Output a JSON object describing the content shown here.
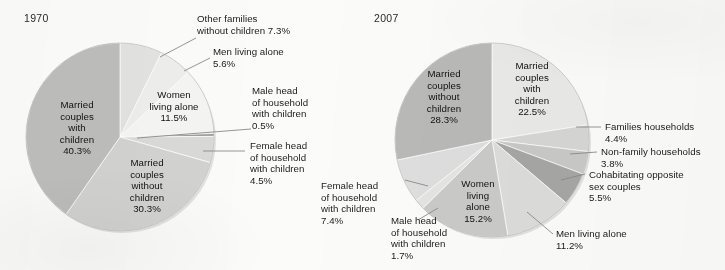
{
  "figure": {
    "background_color": "#fbfbf9",
    "text_color": "#1a1a1a"
  },
  "charts": [
    {
      "year_label": "1970",
      "center": [
        120,
        137
      ],
      "radius": 94
    },
    {
      "year_label": "2007",
      "center": [
        492,
        140
      ],
      "radius": 97
    }
  ],
  "chart_data": [
    {
      "type": "pie",
      "title": "1970",
      "legend": "none",
      "start_angle_deg": 0,
      "direction": "clockwise",
      "categories": [
        "Other families without children",
        "Men living alone",
        "Women living alone",
        "Male head of household with children",
        "Female head of household with children",
        "Married couples without children",
        "Married couples with children"
      ],
      "values": [
        7.3,
        5.6,
        11.5,
        0.5,
        4.5,
        30.3,
        40.3
      ],
      "value_suffix": "%",
      "colors": [
        "#e2e2e0",
        "#ededeb",
        "#f4f4f2",
        "#9e9e9c",
        "#d9d9d7",
        "#d2d2d0",
        "#bdbdbb"
      ]
    },
    {
      "type": "pie",
      "title": "2007",
      "legend": "none",
      "start_angle_deg": 0,
      "direction": "clockwise",
      "categories": [
        "Married couples with children",
        "Families households",
        "Non-family households",
        "Cohabitating opposite sex couples",
        "Men living alone",
        "Women living alone",
        "Male head of household with children",
        "Female head of household with children",
        "Married couples without children"
      ],
      "values": [
        22.5,
        4.4,
        3.8,
        5.5,
        11.2,
        15.2,
        1.7,
        7.4,
        28.3
      ],
      "value_suffix": "%",
      "colors": [
        "#e9e9e7",
        "#d6d6d4",
        "#c9c9c7",
        "#a6a6a4",
        "#dcdcda",
        "#cacac8",
        "#e4e4e2",
        "#dedede",
        "#b9b9b7"
      ]
    }
  ],
  "labels_1970": {
    "inside": [
      {
        "name": "married-with-children",
        "text": "Married\ncouples\nwith\nchildren\n40.3%"
      },
      {
        "name": "married-without-children",
        "text": "Married\ncouples\nwithout\nchildren\n30.3%"
      },
      {
        "name": "women-living-alone",
        "text": "Women\nliving alone\n11.5%"
      }
    ],
    "callouts": [
      {
        "name": "other-families-without-children",
        "text": "Other families\nwithout children 7.3%"
      },
      {
        "name": "men-living-alone",
        "text": "Men living alone\n5.6%"
      },
      {
        "name": "male-head-of-household",
        "text": "Male head\nof household\nwith children\n0.5%"
      },
      {
        "name": "female-head-of-household",
        "text": "Female head\nof household\nwith children\n4.5%"
      }
    ]
  },
  "labels_2007": {
    "inside": [
      {
        "name": "married-without-children",
        "text": "Married\ncouples\nwithout\nchildren\n28.3%"
      },
      {
        "name": "married-with-children",
        "text": "Married\ncouples\nwith\nchildren\n22.5%"
      },
      {
        "name": "women-living-alone",
        "text": "Women\nliving\nalone\n15.2%"
      }
    ],
    "callouts": [
      {
        "name": "families-households",
        "text": "Families households\n4.4%"
      },
      {
        "name": "non-family-households",
        "text": "Non-family households\n3.8%"
      },
      {
        "name": "cohabitating-opposite-sex-couples",
        "text": "Cohabitating opposite\nsex couples\n5.5%"
      },
      {
        "name": "men-living-alone",
        "text": "Men living alone\n11.2%"
      },
      {
        "name": "female-head-of-household",
        "text": "Female head\nof household\nwith children\n7.4%"
      },
      {
        "name": "male-head-of-household",
        "text": "Male head\nof household\nwith children\n1.7%"
      }
    ]
  }
}
